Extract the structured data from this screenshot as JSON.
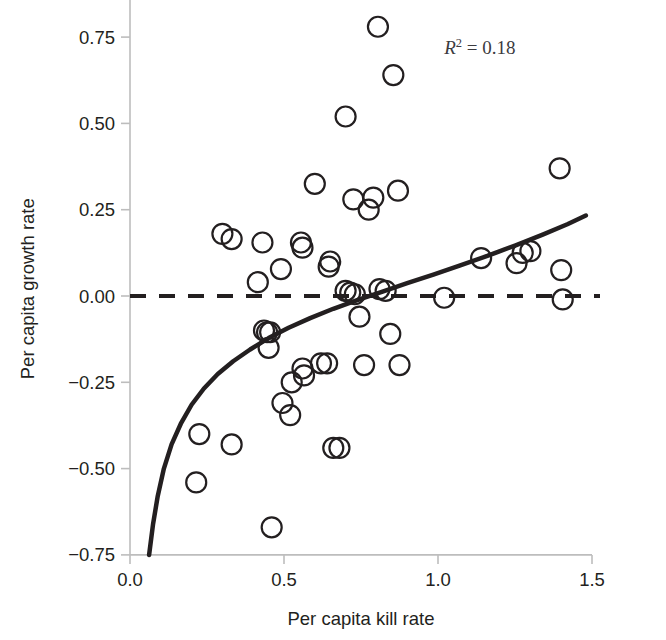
{
  "chart_data": {
    "type": "scatter",
    "title": "",
    "xlabel": "Per capita kill rate",
    "ylabel": "Per capita growth rate",
    "xlim": [
      0.0,
      1.5
    ],
    "ylim": [
      -0.75,
      0.85
    ],
    "grid": false,
    "legend": null,
    "xticks": [
      0.0,
      0.5,
      1.0,
      1.5
    ],
    "xtick_labels": [
      "0.0",
      "0.5",
      "1.0",
      "1.5"
    ],
    "yticks": [
      -0.75,
      -0.5,
      -0.25,
      0.0,
      0.25,
      0.5,
      0.75
    ],
    "ytick_labels": [
      "−0.75",
      "−0.50",
      "−0.25",
      "0.00",
      "0.25",
      "0.50",
      "0.75"
    ],
    "annotations": [
      {
        "name": "r-squared",
        "prefix_italic": "R",
        "superscript": "2",
        "text": " = 0.18",
        "full_text": "R2 = 0.18",
        "x": 1.02,
        "y": 0.7
      }
    ],
    "marker": {
      "style": "open-circle",
      "radius_px": 10,
      "stroke": "#231f20",
      "stroke_width": 2.2,
      "fill": "none"
    },
    "reference_line": {
      "name": "zero-line",
      "orientation": "horizontal",
      "y": 0.0,
      "style": "dashed",
      "color": "#231f20",
      "width": 4
    },
    "fit_curve": {
      "name": "fitted-curve",
      "style": "solid",
      "color": "#231f20",
      "width": 4.5,
      "form": "logarithmic",
      "points": [
        [
          0.062,
          -0.75
        ],
        [
          0.075,
          -0.66
        ],
        [
          0.09,
          -0.58
        ],
        [
          0.11,
          -0.5
        ],
        [
          0.135,
          -0.43
        ],
        [
          0.165,
          -0.37
        ],
        [
          0.2,
          -0.315
        ],
        [
          0.24,
          -0.268
        ],
        [
          0.285,
          -0.226
        ],
        [
          0.335,
          -0.189
        ],
        [
          0.39,
          -0.155
        ],
        [
          0.45,
          -0.122
        ],
        [
          0.515,
          -0.092
        ],
        [
          0.585,
          -0.064
        ],
        [
          0.66,
          -0.037
        ],
        [
          0.74,
          -0.011
        ],
        [
          0.82,
          0.013
        ],
        [
          0.9,
          0.037
        ],
        [
          0.985,
          0.062
        ],
        [
          1.07,
          0.088
        ],
        [
          1.16,
          0.116
        ],
        [
          1.25,
          0.146
        ],
        [
          1.34,
          0.178
        ],
        [
          1.42,
          0.208
        ],
        [
          1.48,
          0.233
        ]
      ]
    },
    "points": [
      [
        0.215,
        -0.54
      ],
      [
        0.225,
        -0.4
      ],
      [
        0.3,
        0.18
      ],
      [
        0.33,
        0.165
      ],
      [
        0.33,
        -0.43
      ],
      [
        0.415,
        0.04
      ],
      [
        0.43,
        0.155
      ],
      [
        0.435,
        -0.1
      ],
      [
        0.445,
        -0.105
      ],
      [
        0.455,
        -0.105
      ],
      [
        0.45,
        -0.15
      ],
      [
        0.46,
        -0.67
      ],
      [
        0.49,
        0.078
      ],
      [
        0.495,
        -0.31
      ],
      [
        0.52,
        -0.345
      ],
      [
        0.525,
        -0.25
      ],
      [
        0.555,
        0.155
      ],
      [
        0.56,
        0.14
      ],
      [
        0.56,
        -0.21
      ],
      [
        0.565,
        -0.23
      ],
      [
        0.6,
        0.325
      ],
      [
        0.62,
        -0.195
      ],
      [
        0.64,
        -0.195
      ],
      [
        0.645,
        0.085
      ],
      [
        0.65,
        0.1
      ],
      [
        0.66,
        -0.44
      ],
      [
        0.68,
        -0.44
      ],
      [
        0.7,
        0.52
      ],
      [
        0.7,
        0.015
      ],
      [
        0.715,
        0.01
      ],
      [
        0.725,
        0.28
      ],
      [
        0.73,
        0.005
      ],
      [
        0.745,
        -0.06
      ],
      [
        0.76,
        -0.2
      ],
      [
        0.775,
        0.25
      ],
      [
        0.79,
        0.285
      ],
      [
        0.805,
        0.78
      ],
      [
        0.81,
        0.02
      ],
      [
        0.83,
        0.015
      ],
      [
        0.845,
        -0.11
      ],
      [
        0.855,
        0.64
      ],
      [
        0.87,
        0.305
      ],
      [
        0.875,
        -0.2
      ],
      [
        1.02,
        -0.005
      ],
      [
        1.14,
        0.11
      ],
      [
        1.255,
        0.095
      ],
      [
        1.275,
        0.125
      ],
      [
        1.3,
        0.13
      ],
      [
        1.395,
        0.37
      ],
      [
        1.4,
        0.075
      ],
      [
        1.405,
        -0.01
      ]
    ]
  },
  "axes": {
    "x_axis_name": "x-axis",
    "y_axis_name": "y-axis"
  }
}
